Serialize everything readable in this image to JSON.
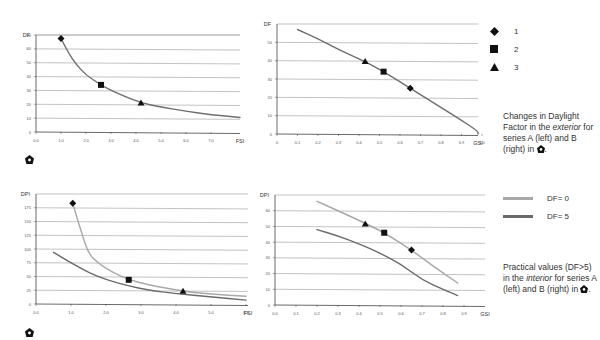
{
  "chart_data": [
    {
      "id": "top-left",
      "type": "line",
      "ylabel": "DF",
      "xlabel": "FSI",
      "xlim": [
        0,
        7.5
      ],
      "ylim": [
        0,
        70
      ],
      "xticks": [
        "0.0",
        "1.0",
        "2.0",
        "3.0",
        "4.0",
        "5.0",
        "6.0",
        "7.0"
      ],
      "yticks": [
        "0",
        "10",
        "20",
        "30",
        "40",
        "50",
        "60",
        "70"
      ],
      "grid": true,
      "series": [
        {
          "name": "curve",
          "color": "#6e6e6e",
          "x": [
            1.0,
            1.3,
            1.6,
            2.0,
            2.6,
            3.0,
            3.5,
            4.2,
            5.0,
            6.0,
            7.0,
            8.2
          ],
          "y": [
            67.5,
            57,
            49,
            41,
            34,
            30,
            26,
            21,
            18,
            15,
            12.5,
            10.5
          ]
        }
      ],
      "markers": [
        {
          "label": "1",
          "shape": "diamond",
          "x": 1.0,
          "y": 67.5
        },
        {
          "label": "2",
          "shape": "square",
          "x": 2.6,
          "y": 34
        },
        {
          "label": "3",
          "shape": "triangle",
          "x": 4.2,
          "y": 21
        }
      ]
    },
    {
      "id": "top-right",
      "type": "line",
      "ylabel": "DF",
      "xlabel": "GSI",
      "xlim": [
        0,
        1.05
      ],
      "ylim": [
        0,
        60
      ],
      "xticks": [
        "0",
        "0.1",
        "0.2",
        "0.3",
        "0.4",
        "0.5",
        "0.6",
        "0.7",
        "0.8",
        "0.9",
        "1.0"
      ],
      "yticks": [
        "0",
        "10",
        "20",
        "30",
        "40",
        "50"
      ],
      "grid": true,
      "series": [
        {
          "name": "curve",
          "color": "#6e6e6e",
          "x": [
            0.1,
            0.2,
            0.3,
            0.43,
            0.52,
            0.65,
            0.8,
            0.9,
            1.0,
            1.07
          ],
          "y": [
            57,
            52,
            46,
            39.5,
            34,
            25,
            14.5,
            7.5,
            1.5,
            0
          ]
        }
      ],
      "markers": [
        {
          "label": "3",
          "shape": "triangle",
          "x": 0.43,
          "y": 39.5
        },
        {
          "label": "2",
          "shape": "square",
          "x": 0.52,
          "y": 34
        },
        {
          "label": "1",
          "shape": "diamond",
          "x": 0.65,
          "y": 25
        }
      ]
    },
    {
      "id": "bottom-left",
      "type": "line",
      "ylabel": "DPI",
      "xlabel": "FSI",
      "xlim": [
        0,
        6.2
      ],
      "ylim": [
        0,
        200
      ],
      "xticks": [
        "0.0",
        "1.0",
        "2.0",
        "3.0",
        "4.0",
        "5.0",
        "6.0"
      ],
      "yticks": [
        "0",
        "25",
        "50",
        "75",
        "100",
        "125",
        "150",
        "175"
      ],
      "grid": true,
      "series": [
        {
          "name": "DF=0",
          "color": "#a8a8a8",
          "x": [
            1.05,
            1.3,
            1.5,
            1.75,
            2.2,
            2.65,
            3.2,
            4.2,
            5.0,
            6.0
          ],
          "y": [
            183,
            130,
            92,
            75,
            57,
            44,
            35,
            23,
            18,
            14
          ]
        },
        {
          "name": "DF=5",
          "color": "#6a6a6a",
          "x": [
            0.5,
            1.0,
            1.5,
            2.0,
            2.65,
            3.2,
            4.0,
            5.0,
            6.0
          ],
          "y": [
            94,
            75,
            57,
            44,
            33,
            25,
            19,
            13,
            7
          ]
        }
      ],
      "markers": [
        {
          "label": "1",
          "shape": "diamond",
          "x": 1.05,
          "y": 183
        },
        {
          "label": "2",
          "shape": "square",
          "x": 2.65,
          "y": 44
        },
        {
          "label": "3",
          "shape": "triangle",
          "x": 4.2,
          "y": 23
        }
      ]
    },
    {
      "id": "bottom-right",
      "type": "line",
      "ylabel": "DPI",
      "xlabel": "GSI",
      "xlim": [
        0,
        0.95
      ],
      "ylim": [
        0,
        70
      ],
      "xticks": [
        "0.0",
        "0.1",
        "0.2",
        "0.3",
        "0.4",
        "0.5",
        "0.6",
        "0.7",
        "0.8",
        "0.9"
      ],
      "yticks": [
        "0",
        "10",
        "20",
        "30",
        "40",
        "50",
        "60"
      ],
      "grid": true,
      "series": [
        {
          "name": "DF=0",
          "color": "#a8a8a8",
          "x": [
            0.2,
            0.3,
            0.43,
            0.52,
            0.65,
            0.75,
            0.87
          ],
          "y": [
            66,
            60,
            52,
            46,
            35,
            25,
            14
          ]
        },
        {
          "name": "DF=5",
          "color": "#6a6a6a",
          "x": [
            0.2,
            0.3,
            0.4,
            0.5,
            0.6,
            0.7,
            0.8,
            0.87
          ],
          "y": [
            48,
            44,
            39,
            33,
            26,
            16,
            10,
            6
          ]
        }
      ],
      "markers": [
        {
          "label": "3",
          "shape": "triangle",
          "x": 0.43,
          "y": 51.5
        },
        {
          "label": "2",
          "shape": "square",
          "x": 0.52,
          "y": 46
        },
        {
          "label": "1",
          "shape": "diamond",
          "x": 0.65,
          "y": 35
        }
      ]
    }
  ],
  "legend_markers": [
    {
      "shape": "diamond",
      "label": "1"
    },
    {
      "shape": "square",
      "label": "2"
    },
    {
      "shape": "triangle",
      "label": "3"
    }
  ],
  "legend_lines": [
    {
      "label": "DF= 0",
      "color": "#a8a8a8"
    },
    {
      "label": "DF= 5",
      "color": "#6a6a6a"
    }
  ],
  "caption_top": {
    "part1": "Changes in Daylight Factor in the ",
    "italic": "exterior",
    "part2": " for series A (left) and B (right) in ",
    "end": "."
  },
  "caption_bottom": {
    "part1": "Practical values (DF>5) in the ",
    "italic": "interior",
    "part2": " for series A (left) and B (right) in ",
    "end": "."
  },
  "icons": {
    "note": "house-marker-icon"
  }
}
